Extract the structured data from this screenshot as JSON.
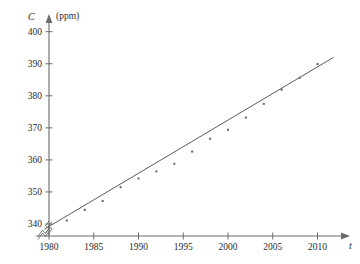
{
  "chart_data": {
    "type": "scatter",
    "title": "",
    "xlabel": "t",
    "ylabel": "C",
    "yunit": "(ppm)",
    "xlim": [
      1978.6,
      2012.5
    ],
    "ylim": [
      336.0,
      401.5
    ],
    "grid": false,
    "legend": null,
    "axis_break_x": true,
    "axis_break_y": true,
    "xticks": [
      1980,
      1985,
      1990,
      1995,
      2000,
      2005,
      2010
    ],
    "xtick_labels": [
      "1980",
      "1985",
      "1990",
      "1995",
      "2000",
      "2005",
      "2010"
    ],
    "yticks": [
      340,
      350,
      360,
      370,
      380,
      390,
      400
    ],
    "ytick_labels": [
      "340",
      "350",
      "360",
      "370",
      "380",
      "390",
      "400"
    ],
    "x": [
      1980,
      1982,
      1984,
      1986,
      1988,
      1990,
      1992,
      1994,
      1996,
      1998,
      2000,
      2002,
      2004,
      2006,
      2008,
      2010
    ],
    "y": [
      338.7,
      341.1,
      344.4,
      347.2,
      351.5,
      354.2,
      356.4,
      358.8,
      362.6,
      366.6,
      369.4,
      373.2,
      377.5,
      381.9,
      385.6,
      389.9
    ],
    "series": [
      {
        "name": "CO2 concentration",
        "points": [
          {
            "t": 1980,
            "c": 338.7
          },
          {
            "t": 1982,
            "c": 341.1
          },
          {
            "t": 1984,
            "c": 344.4
          },
          {
            "t": 1986,
            "c": 347.2
          },
          {
            "t": 1988,
            "c": 351.5
          },
          {
            "t": 1990,
            "c": 354.2
          },
          {
            "t": 1992,
            "c": 356.4
          },
          {
            "t": 1994,
            "c": 358.8
          },
          {
            "t": 1996,
            "c": 362.6
          },
          {
            "t": 1998,
            "c": 366.6
          },
          {
            "t": 2000,
            "c": 369.4
          },
          {
            "t": 2002,
            "c": 373.2
          },
          {
            "t": 2004,
            "c": 377.5
          },
          {
            "t": 2006,
            "c": 381.9
          },
          {
            "t": 2008,
            "c": 385.6
          },
          {
            "t": 2010,
            "c": 389.9
          }
        ]
      }
    ],
    "fit_line": {
      "name": "linear regression line",
      "x_start": 1979.5,
      "y_start": 338.4,
      "x_end": 2011.8,
      "y_end": 392.0
    }
  }
}
